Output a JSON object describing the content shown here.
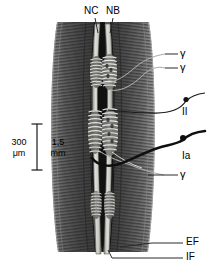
{
  "figure": {
    "type": "anatomical-diagram",
    "background_color": "#ffffff"
  },
  "labels": {
    "nuclear_chain": "NC",
    "nuclear_bag": "NB",
    "gamma_top1": "γ",
    "gamma_top2": "γ",
    "gamma_lower": "γ",
    "afferent_II": "II",
    "afferent_Ia": "Ia",
    "extrafusal_fiber": "EF",
    "intrafusal_fiber": "IF"
  },
  "scale_bar": {
    "left_value": "300",
    "left_unit": "μm",
    "right_value": "1,5",
    "right_unit": "mm"
  },
  "colors": {
    "ink": "#000000",
    "muscle_dark": "#4a4a4a",
    "muscle_mid": "#6e6e6e",
    "muscle_light": "#9a9a9a",
    "capsule_void": "#0a0a0a",
    "fiber_pale": "#d8d8d4",
    "fiber_shadow": "#8f8f8b",
    "leader": "#3a3a3a"
  }
}
